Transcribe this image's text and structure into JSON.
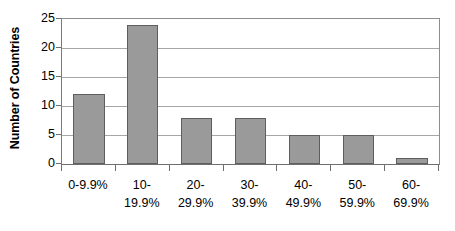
{
  "chart_data": {
    "type": "bar",
    "title": "",
    "xlabel": "",
    "ylabel": "Number of Countries",
    "categories": [
      "0-9.9%",
      "10-\n19.9%",
      "20-\n29.9%",
      "30-\n39.9%",
      "40-\n49.9%",
      "50-\n59.9%",
      "60-\n69.9%"
    ],
    "values": [
      12,
      24,
      8,
      8,
      5,
      5,
      1
    ],
    "ylim": [
      0,
      25
    ],
    "ytick_labels": [
      "25",
      "20",
      "15",
      "10",
      "5",
      "0"
    ],
    "ytick_values": [
      25,
      20,
      15,
      10,
      5,
      0
    ],
    "grid": true,
    "legend": "none",
    "colors": {
      "bar_fill": "#9a9a9a",
      "bar_stroke": "#5e5e5e",
      "gridline": "#a6a6a6",
      "axis": "#6f6f6f",
      "plot_background": "#ffffff",
      "text": "#000000"
    }
  }
}
